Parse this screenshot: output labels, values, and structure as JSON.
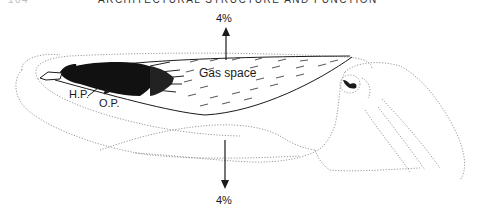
{
  "header": {
    "page_number": "104",
    "running_title": "ARCHITECTURAL STRUCTURE AND FUNCTION"
  },
  "figure": {
    "labels": {
      "top_percent": "4%",
      "bottom_percent": "4%",
      "gas_space": "Gas space",
      "hp": "H.P.",
      "op": "O.P."
    },
    "arrows": [
      {
        "direction": "up",
        "label": "4%"
      },
      {
        "direction": "down",
        "label": "4%"
      }
    ],
    "colors": {
      "ink": "#1a1a1a",
      "dotted_outline": "#9a9a9a",
      "background": "#ffffff"
    }
  }
}
